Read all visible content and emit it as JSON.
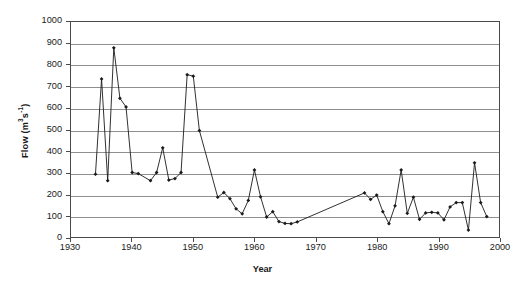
{
  "chart_data": {
    "type": "line",
    "title": "",
    "subtitle": "",
    "xlabel": "Year",
    "ylabel": "Flow (m3s-1)",
    "ylabel_parts": {
      "base": "Flow (m",
      "sup1": "3",
      "mid": "s",
      "sup2": "-1",
      "tail": ")"
    },
    "xlim": [
      1930,
      2000
    ],
    "ylim": [
      0,
      1000
    ],
    "xticks": [
      1930,
      1940,
      1950,
      1960,
      1970,
      1980,
      1990,
      2000
    ],
    "yticks": [
      0,
      100,
      200,
      300,
      400,
      500,
      600,
      700,
      800,
      900,
      1000
    ],
    "grid": "horizontal",
    "legend": "none",
    "marker": "filled-diamond",
    "line_color": "#1a1a1a",
    "marker_color": "#1a1a1a",
    "grid_color": "#8f8f8f",
    "axis_color": "#4a4a4a",
    "background": "#ffffff",
    "series": [
      {
        "name": "Flow",
        "x": [
          1934,
          1935,
          1936,
          1937,
          1938,
          1939,
          1940,
          1941,
          1943,
          1944,
          1945,
          1946,
          1947,
          1948,
          1949,
          1950,
          1951,
          1954,
          1955,
          1956,
          1957,
          1958,
          1959,
          1960,
          1961,
          1962,
          1963,
          1964,
          1965,
          1966,
          1967,
          1978,
          1979,
          1980,
          1981,
          1982,
          1983,
          1984,
          1985,
          1986,
          1987,
          1988,
          1989,
          1990,
          1991,
          1992,
          1993,
          1994,
          1995,
          1996,
          1997,
          1998
        ],
        "values": [
          292,
          735,
          262,
          880,
          645,
          605,
          300,
          295,
          262,
          300,
          415,
          265,
          272,
          300,
          755,
          748,
          495,
          185,
          207,
          178,
          131,
          108,
          170,
          312,
          187,
          93,
          118,
          72,
          63,
          62,
          70,
          205,
          175,
          195,
          118,
          62,
          145,
          312,
          110,
          185,
          82,
          112,
          115,
          112,
          80,
          140,
          160,
          160,
          32,
          345,
          160,
          95
        ]
      }
    ]
  }
}
